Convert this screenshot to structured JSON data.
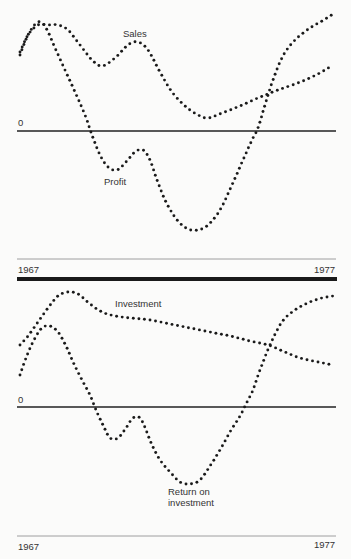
{
  "chart_data": [
    {
      "type": "line",
      "title": "",
      "style": "dotted",
      "xlabel": "",
      "ylabel": "",
      "x_range_labels": [
        "1967",
        "1977"
      ],
      "zero_label": "0",
      "grid": false,
      "legend": "inline labels",
      "x": [
        1967,
        1968,
        1969,
        1970,
        1971,
        1972,
        1973,
        1974,
        1975,
        1976,
        1977
      ],
      "series": [
        {
          "name": "Sales",
          "label_pos": [
            116,
            38
          ],
          "points": [
            [
              20,
              52
            ],
            [
              28,
              35
            ],
            [
              38,
              25
            ],
            [
              48,
              25
            ],
            [
              58,
              25
            ],
            [
              68,
              30
            ],
            [
              80,
              45
            ],
            [
              92,
              60
            ],
            [
              102,
              66
            ],
            [
              115,
              58
            ],
            [
              128,
              45
            ],
            [
              138,
              42
            ],
            [
              148,
              50
            ],
            [
              160,
              72
            ],
            [
              172,
              92
            ],
            [
              185,
              106
            ],
            [
              198,
              115
            ],
            [
              208,
              118
            ],
            [
              222,
              113
            ],
            [
              240,
              106
            ],
            [
              258,
              98
            ],
            [
              278,
              90
            ],
            [
              298,
              83
            ],
            [
              318,
              74
            ],
            [
              333,
              65
            ]
          ]
        },
        {
          "name": "Profit",
          "label_pos": [
            104,
            185
          ],
          "points": [
            [
              20,
              55
            ],
            [
              28,
              35
            ],
            [
              38,
              22
            ],
            [
              46,
              28
            ],
            [
              55,
              48
            ],
            [
              65,
              70
            ],
            [
              75,
              92
            ],
            [
              85,
              115
            ],
            [
              92,
              135
            ],
            [
              100,
              155
            ],
            [
              108,
              167
            ],
            [
              117,
              170
            ],
            [
              126,
              162
            ],
            [
              135,
              152
            ],
            [
              143,
              150
            ],
            [
              150,
              160
            ],
            [
              157,
              180
            ],
            [
              166,
              202
            ],
            [
              177,
              220
            ],
            [
              188,
              229
            ],
            [
              198,
              230
            ],
            [
              208,
              225
            ],
            [
              220,
              210
            ],
            [
              232,
              185
            ],
            [
              243,
              160
            ],
            [
              252,
              140
            ],
            [
              258,
              128
            ],
            [
              265,
              105
            ],
            [
              273,
              80
            ],
            [
              283,
              56
            ],
            [
              295,
              40
            ],
            [
              310,
              28
            ],
            [
              322,
              21
            ],
            [
              333,
              14
            ]
          ]
        }
      ]
    },
    {
      "type": "line",
      "title": "",
      "style": "dotted",
      "xlabel": "",
      "ylabel": "",
      "x_range_labels": [
        "1967",
        "1977"
      ],
      "zero_label": "0",
      "grid": false,
      "legend": "inline labels",
      "x": [
        1967,
        1968,
        1969,
        1970,
        1971,
        1972,
        1973,
        1974,
        1975,
        1976,
        1977
      ],
      "series": [
        {
          "name": "Investment",
          "label_pos": [
            115,
            307
          ],
          "points": [
            [
              20,
              345
            ],
            [
              28,
              336
            ],
            [
              38,
              322
            ],
            [
              48,
              308
            ],
            [
              58,
              296
            ],
            [
              68,
              292
            ],
            [
              78,
              294
            ],
            [
              90,
              304
            ],
            [
              102,
              312
            ],
            [
              115,
              316
            ],
            [
              130,
              318
            ],
            [
              150,
              320
            ],
            [
              170,
              324
            ],
            [
              190,
              328
            ],
            [
              210,
              332
            ],
            [
              230,
              336
            ],
            [
              250,
              341
            ],
            [
              268,
              345
            ],
            [
              285,
              352
            ],
            [
              300,
              358
            ],
            [
              318,
              362
            ],
            [
              333,
              365
            ]
          ]
        },
        {
          "name": "Return on investment",
          "label_pos": [
            168,
            494
          ],
          "points": [
            [
              20,
              375
            ],
            [
              26,
              358
            ],
            [
              34,
              340
            ],
            [
              42,
              328
            ],
            [
              50,
              326
            ],
            [
              58,
              332
            ],
            [
              66,
              346
            ],
            [
              74,
              364
            ],
            [
              82,
              380
            ],
            [
              90,
              395
            ],
            [
              96,
              410
            ],
            [
              103,
              425
            ],
            [
              110,
              438
            ],
            [
              118,
              438
            ],
            [
              126,
              428
            ],
            [
              133,
              418
            ],
            [
              140,
              418
            ],
            [
              146,
              430
            ],
            [
              152,
              445
            ],
            [
              160,
              460
            ],
            [
              170,
              472
            ],
            [
              180,
              482
            ],
            [
              190,
              484
            ],
            [
              200,
              480
            ],
            [
              210,
              466
            ],
            [
              220,
              450
            ],
            [
              230,
              432
            ],
            [
              240,
              416
            ],
            [
              247,
              402
            ],
            [
              253,
              390
            ],
            [
              260,
              370
            ],
            [
              270,
              345
            ],
            [
              282,
              322
            ],
            [
              295,
              310
            ],
            [
              310,
              302
            ],
            [
              322,
              298
            ],
            [
              333,
              296
            ]
          ]
        }
      ]
    }
  ],
  "top_chart": {
    "zero": "0",
    "start_year": "1967",
    "end_year": "1977",
    "label_sales": "Sales",
    "label_profit": "Profit"
  },
  "bottom_chart": {
    "zero": "0",
    "start_year": "1967",
    "end_year": "1977",
    "label_investment": "Investment",
    "label_roi_1": "Return on",
    "label_roi_2": "investment"
  }
}
